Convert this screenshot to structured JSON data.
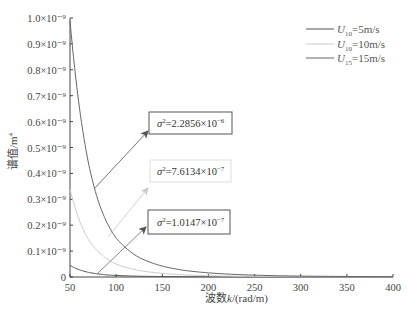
{
  "chart_data": {
    "type": "line",
    "title": "",
    "xlabel": "波数k/(rad/m)",
    "ylabel": "谱值/m⁴",
    "xlim": [
      50,
      400
    ],
    "ylim": [
      0,
      1e-09
    ],
    "grid": false,
    "legend_position": "upper right",
    "x_ticks": [
      50,
      100,
      150,
      200,
      250,
      300,
      350,
      400
    ],
    "x_tick_labels": [
      "50",
      "100",
      "150",
      "200",
      "250",
      "300",
      "350",
      "400"
    ],
    "y_ticks": [
      0,
      1e-10,
      2e-10,
      3e-10,
      4e-10,
      5e-10,
      6e-10,
      7e-10,
      8e-10,
      9e-10,
      1e-09
    ],
    "y_tick_labels": [
      "0",
      "0.1×10⁻⁹",
      "0.2×10⁻⁹",
      "0.3×10⁻⁹",
      "0.4×10⁻⁹",
      "0.5×10⁻⁹",
      "0.6×10⁻⁹",
      "0.7×10⁻⁹",
      "0.8×10⁻⁹",
      "0.9×10⁻⁹",
      "1.0×10⁻⁹"
    ],
    "x": [
      50,
      60,
      70,
      80,
      90,
      100,
      125,
      150,
      175,
      200,
      250,
      300,
      350,
      400
    ],
    "series": [
      {
        "name": "U10=5m/s",
        "color": "#555555",
        "values": [
          4.5e-11,
          2.8e-11,
          1.8e-11,
          1.2e-11,
          8e-12,
          6e-12,
          3e-12,
          1.8e-12,
          1.1e-12,
          7e-13,
          3e-13,
          1.5e-13,
          8e-14,
          5e-14
        ]
      },
      {
        "name": "U10=10m/s",
        "color": "#cccccc",
        "values": [
          3.4e-10,
          2.2e-10,
          1.45e-10,
          1e-10,
          7e-11,
          5e-11,
          2.5e-11,
          1.4e-11,
          8e-12,
          5e-12,
          2.2e-12,
          1.1e-12,
          6e-13,
          4e-13
        ]
      },
      {
        "name": "U15=15m/s",
        "color": "#666666",
        "values": [
          9.9e-10,
          6.6e-10,
          4.4e-10,
          3e-10,
          2.1e-10,
          1.5e-10,
          7.5e-11,
          4.2e-11,
          2.5e-11,
          1.6e-11,
          7e-12,
          3.5e-12,
          2e-12,
          1.2e-12
        ]
      }
    ],
    "annotations": [
      {
        "text": "σ²=2.2856×10⁻⁶",
        "target_series": "U15=15m/s"
      },
      {
        "text": "σ²=7.6134×10⁻⁷",
        "target_series": "U10=10m/s"
      },
      {
        "text": "σ²=1.0147×10⁻⁷",
        "target_series": "U10=5m/s"
      }
    ]
  },
  "legend": {
    "items": [
      {
        "var": "U",
        "sub": "10",
        "rest": "=5m/s",
        "color": "#555555"
      },
      {
        "var": "U",
        "sub": "10",
        "rest": "=10m/s",
        "color": "#cccccc"
      },
      {
        "var": "U",
        "sub": "15",
        "rest": "=15m/s",
        "color": "#666666"
      }
    ]
  },
  "annotations": {
    "a1": {
      "sym": "σ",
      "sup": "2",
      "mid": "=2.2856×10",
      "exp": "−6"
    },
    "a2": {
      "sym": "σ",
      "sup": "2",
      "mid": "=7.6134×10",
      "exp": "−7"
    },
    "a3": {
      "sym": "σ",
      "sup": "2",
      "mid": "=1.0147×10",
      "exp": "−7"
    }
  },
  "axes": {
    "xlabel_main": "波数",
    "xlabel_var": "k",
    "xlabel_unit": "/(rad/m)",
    "ylabel_main": "谱值/m",
    "ylabel_sup": "4"
  }
}
